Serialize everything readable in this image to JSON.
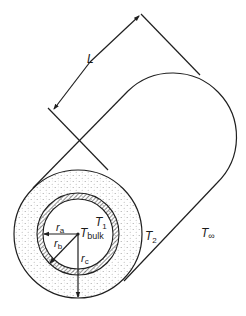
{
  "figure": {
    "type": "insulated-pipe-cross-section",
    "labels": {
      "length": "L",
      "t1": "T",
      "t1_sub": "1",
      "t2": "T",
      "t2_sub": "2",
      "t_inf": "T",
      "t_inf_sub": "∞",
      "t_bulk": "T",
      "t_bulk_sub": "bulk",
      "ra": "r",
      "ra_sub": "a",
      "rb": "r",
      "rb_sub": "b",
      "rc": "r",
      "rc_sub": "c"
    },
    "colors": {
      "line": "#1f1f1f",
      "hatch": "#3a3a3a",
      "insulation_dots": "#9a9a9a",
      "background": "#ffffff"
    }
  }
}
